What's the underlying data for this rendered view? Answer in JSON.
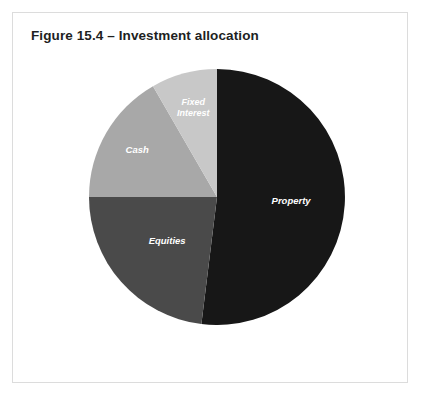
{
  "figure": {
    "title": "Figure 15.4 – Investment allocation",
    "border_color": "#dcdcdc",
    "background": "#ffffff"
  },
  "chart_data": {
    "type": "pie",
    "title": "Figure 15.4 – Investment allocation",
    "xlabel": "",
    "ylabel": "",
    "legend_position": "none",
    "labels_inside_slices": true,
    "start_angle_deg": 0,
    "direction": "clockwise",
    "categories": [
      "Property",
      "Equities",
      "Cash",
      "Fixed Interest"
    ],
    "values": [
      52,
      23,
      17,
      8
    ],
    "colors": [
      "#171717",
      "#4a4a4a",
      "#a8a8a8",
      "#c8c8c8"
    ],
    "label_colors": [
      "#ffffff",
      "#ffffff",
      "#ffffff",
      "#ffffff"
    ],
    "slices": [
      {
        "label": "Property",
        "label_line_1": "Property",
        "label_line_2": "",
        "value": 52,
        "color": "#171717",
        "start_deg": 0,
        "end_deg": 187
      },
      {
        "label": "Equities",
        "label_line_1": "Equities",
        "label_line_2": "",
        "value": 23,
        "color": "#4a4a4a",
        "start_deg": 187,
        "end_deg": 270
      },
      {
        "label": "Cash",
        "label_line_1": "Cash",
        "label_line_2": "",
        "value": 17,
        "color": "#a8a8a8",
        "start_deg": 270,
        "end_deg": 330
      },
      {
        "label": "Fixed Interest",
        "label_line_1": "Fixed",
        "label_line_2": "Interest",
        "value": 8,
        "color": "#c8c8c8",
        "start_deg": 330,
        "end_deg": 360
      }
    ]
  }
}
